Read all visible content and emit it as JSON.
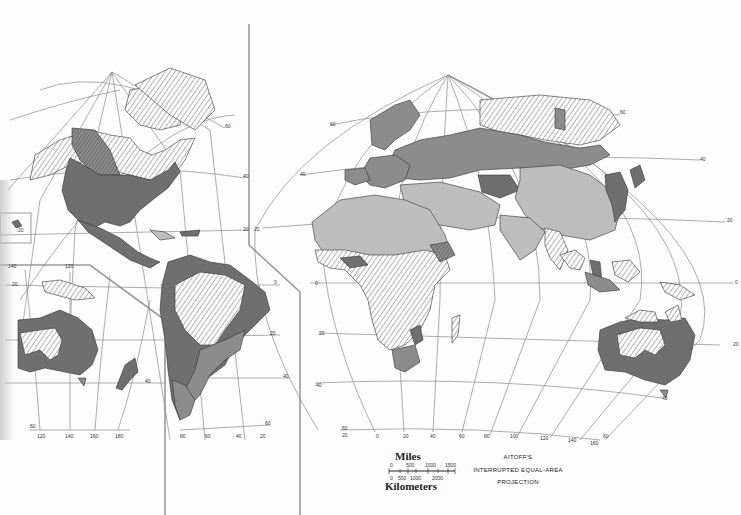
{
  "map": {
    "projection_label": [
      "AITOFF'S",
      "INTERRUPTED EQUAL-AREA",
      "PROJECTION"
    ],
    "scale": {
      "miles_label": "Miles",
      "kilometers_label": "Kilometers",
      "miles_ticks": [
        "0",
        "500",
        "1000",
        "1500"
      ],
      "km_ticks": [
        "0",
        "500",
        "1000",
        "2000"
      ]
    },
    "colors": {
      "dark": "#6f6f6f",
      "mid": "#8c8c8c",
      "light": "#bdbdbd",
      "hatch_line": "#555555",
      "graticule": "#8a8a8a",
      "frame": "#9a9a9a",
      "background": "#fdfdfd"
    },
    "lobes": {
      "americas": {
        "lat_labels": [
          "60",
          "40",
          "20",
          "0",
          "20",
          "40",
          "60"
        ],
        "lon_labels_bottom": [
          "80",
          "60",
          "40",
          "20"
        ]
      },
      "pacific_inset": {
        "lon_labels_top": [
          "140",
          "120"
        ],
        "lon_labels_bottom": [
          "120",
          "140",
          "160",
          "180"
        ],
        "lat_labels": [
          "20",
          "0",
          "20",
          "40",
          "60"
        ]
      },
      "eurasia_africa": {
        "lat_labels": [
          "60",
          "40",
          "20",
          "0",
          "20",
          "40",
          "60"
        ],
        "lon_labels_bottom": [
          "20",
          "0",
          "20",
          "40",
          "60",
          "80",
          "100",
          "120",
          "140",
          "160"
        ]
      }
    }
  }
}
